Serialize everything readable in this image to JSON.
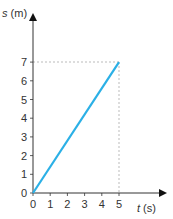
{
  "chart_data": {
    "type": "line",
    "title": "",
    "xlabel_var": "t",
    "xlabel_unit": " (s)",
    "ylabel_var": "s",
    "ylabel_unit": " (m)",
    "xlim": [
      0,
      5
    ],
    "ylim": [
      0,
      7
    ],
    "x_ticks": [
      "0",
      "1",
      "2",
      "3",
      "4",
      "5"
    ],
    "y_ticks": [
      "0",
      "1",
      "2",
      "3",
      "4",
      "5",
      "6",
      "7"
    ],
    "grid": false,
    "series": [
      {
        "name": "s vs t",
        "x": [
          0,
          5
        ],
        "y": [
          0,
          7
        ],
        "color": "#2bb0e6"
      }
    ],
    "annotations": [
      {
        "type": "dashed-guide",
        "from": [
          0,
          7
        ],
        "to": [
          5,
          7
        ]
      },
      {
        "type": "dashed-guide",
        "from": [
          5,
          0
        ],
        "to": [
          5,
          7
        ]
      }
    ]
  },
  "colors": {
    "line": "#2bb0e6",
    "axis": "#333333",
    "guide": "#aaaaaa"
  }
}
